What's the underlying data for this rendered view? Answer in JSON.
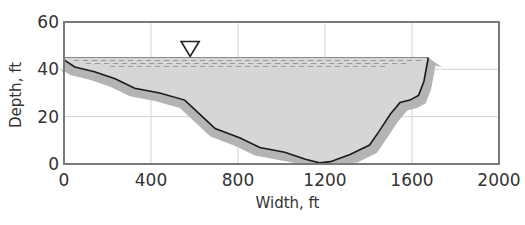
{
  "chart_data": {
    "type": "area",
    "title": "",
    "xlabel": "Width, ft",
    "ylabel": "Depth, ft",
    "xlim": [
      0,
      2000
    ],
    "ylim": [
      0,
      60
    ],
    "xticks": [
      0,
      400,
      800,
      1200,
      1600,
      2000
    ],
    "yticks": [
      0,
      20,
      40,
      60
    ],
    "grid": true,
    "legend": null,
    "water_surface_depth": 45,
    "water_surface_marker": {
      "symbol": "inverted-triangle",
      "x": 580,
      "y": 45
    },
    "series": [
      {
        "name": "Channel bed profile",
        "x": [
          0,
          50,
          140,
          235,
          325,
          440,
          555,
          625,
          695,
          810,
          900,
          1015,
          1110,
          1175,
          1225,
          1315,
          1405,
          1450,
          1500,
          1545,
          1590,
          1630,
          1655,
          1675
        ],
        "y": [
          44,
          41,
          39,
          36,
          32,
          30,
          27,
          21,
          15,
          11,
          7,
          5,
          2,
          0.5,
          1,
          4,
          8,
          14,
          21,
          26,
          27,
          29,
          35,
          45
        ]
      }
    ],
    "colors": {
      "water": "#d6d6d6",
      "bank": "#b4b4b4",
      "bed_line": "#1a1a1a",
      "frame": "#7a7a7a",
      "grid": "#d4d4d4",
      "dashes": "#9a9a9a"
    }
  }
}
